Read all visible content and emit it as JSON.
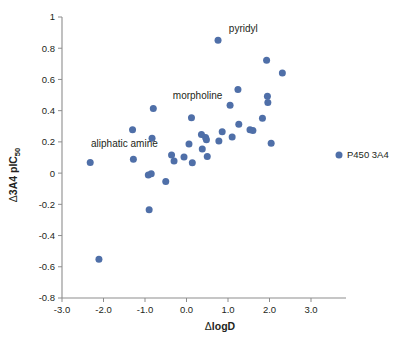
{
  "figure": {
    "background_color": "#ffffff",
    "marker_color": "#4f6fa8",
    "axis_color": "#8d8d8d",
    "text_color": "#231f20"
  },
  "axes": {
    "x_title_delta": "Δ",
    "x_title_main": "logD",
    "x_title_full": "ΔlogD",
    "y_title_delta": "Δ",
    "y_title_main": "3A4 pIC",
    "y_title_sub": "50",
    "y_title_full": "Δ3A4 pIC50",
    "x_ticks": [
      "-3.0",
      "-2.0",
      "-1.0",
      "0.0",
      "1.0",
      "2.0",
      "3.0"
    ],
    "x_tick_values": [
      -3.0,
      -2.0,
      -1.0,
      0.0,
      1.0,
      2.0,
      3.0
    ],
    "y_ticks": [
      "1",
      "0.8",
      "0.6",
      "0.4",
      "0.2",
      "0",
      "-0.2",
      "-0.4",
      "-0.6",
      "-0.8"
    ],
    "y_tick_values": [
      1.0,
      0.8,
      0.6,
      0.4,
      0.2,
      0.0,
      -0.2,
      -0.4,
      -0.6,
      -0.8
    ]
  },
  "legend": {
    "entries": [
      {
        "label": "P450 3A4",
        "color": "#4f6fa8",
        "marker": "circle"
      }
    ]
  },
  "annotations": [
    {
      "text": "pyridyl",
      "x": 1.02,
      "y": 0.905,
      "anchor": "start"
    },
    {
      "text": "morpholine",
      "x": -0.33,
      "y": 0.475,
      "anchor": "start"
    },
    {
      "text": "aliphatic amine",
      "x": -2.3,
      "y": 0.165,
      "anchor": "start"
    }
  ],
  "chart_data": {
    "type": "scatter",
    "title": "",
    "xlabel": "ΔlogD",
    "ylabel": "Δ3A4 pIC50",
    "xlim": [
      -3.0,
      3.0
    ],
    "ylim": [
      -0.8,
      1.0
    ],
    "grid": false,
    "legend_position": "right",
    "series": [
      {
        "name": "P450 3A4",
        "color": "#4f6fa8",
        "points": [
          {
            "x": -2.32,
            "y": 0.068
          },
          {
            "x": -2.11,
            "y": -0.552
          },
          {
            "x": -1.3,
            "y": 0.278
          },
          {
            "x": -1.28,
            "y": 0.088
          },
          {
            "x": -0.92,
            "y": -0.012
          },
          {
            "x": -0.9,
            "y": -0.234
          },
          {
            "x": -0.85,
            "y": -0.004
          },
          {
            "x": -0.83,
            "y": 0.224
          },
          {
            "x": -0.8,
            "y": 0.414
          },
          {
            "x": -0.5,
            "y": -0.054
          },
          {
            "x": -0.36,
            "y": 0.116
          },
          {
            "x": -0.3,
            "y": 0.078
          },
          {
            "x": -0.06,
            "y": 0.104
          },
          {
            "x": 0.06,
            "y": 0.186
          },
          {
            "x": 0.12,
            "y": 0.354
          },
          {
            "x": 0.14,
            "y": 0.066
          },
          {
            "x": 0.36,
            "y": 0.248
          },
          {
            "x": 0.38,
            "y": 0.155
          },
          {
            "x": 0.46,
            "y": 0.228
          },
          {
            "x": 0.48,
            "y": 0.213
          },
          {
            "x": 0.5,
            "y": 0.106
          },
          {
            "x": 0.76,
            "y": 0.851
          },
          {
            "x": 0.78,
            "y": 0.205
          },
          {
            "x": 0.86,
            "y": 0.265
          },
          {
            "x": 1.05,
            "y": 0.434
          },
          {
            "x": 1.1,
            "y": 0.232
          },
          {
            "x": 1.24,
            "y": 0.535
          },
          {
            "x": 1.26,
            "y": 0.313
          },
          {
            "x": 1.53,
            "y": 0.278
          },
          {
            "x": 1.6,
            "y": 0.273
          },
          {
            "x": 1.83,
            "y": 0.352
          },
          {
            "x": 1.93,
            "y": 0.723
          },
          {
            "x": 1.95,
            "y": 0.492
          },
          {
            "x": 1.96,
            "y": 0.452
          },
          {
            "x": 2.04,
            "y": 0.192
          },
          {
            "x": 2.31,
            "y": 0.641
          }
        ]
      }
    ],
    "annotations": [
      {
        "text": "pyridyl",
        "points_to": {
          "x": 0.76,
          "y": 0.851
        }
      },
      {
        "text": "morpholine",
        "points_to": {
          "x": -0.8,
          "y": 0.414
        }
      },
      {
        "text": "aliphatic amine",
        "points_to": {
          "x": -2.32,
          "y": 0.068
        }
      }
    ]
  }
}
